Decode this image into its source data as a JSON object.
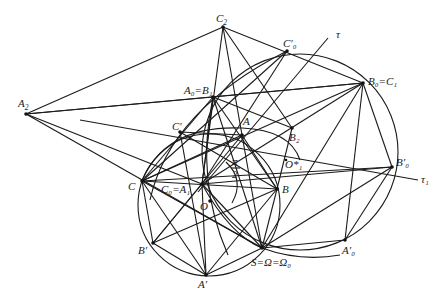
{
  "figure": {
    "points": [
      {
        "id": "C2",
        "label": "C",
        "sub": "2",
        "prime": false
      },
      {
        "id": "A2",
        "label": "A",
        "sub": "2",
        "prime": false
      },
      {
        "id": "A0B1",
        "label": "A₀=B₁"
      },
      {
        "id": "B0C1",
        "label": "B₀=C₁"
      },
      {
        "id": "C0p",
        "label": "C′₀"
      },
      {
        "id": "A",
        "label": "A"
      },
      {
        "id": "B2",
        "label": "B₂"
      },
      {
        "id": "Cp",
        "label": "C′"
      },
      {
        "id": "C",
        "label": "C"
      },
      {
        "id": "C0A1",
        "label": "C₀=A₁"
      },
      {
        "id": "B",
        "label": "B"
      },
      {
        "id": "O",
        "label": "O"
      },
      {
        "id": "O1s",
        "label": "O*₁"
      },
      {
        "id": "Bp",
        "label": "B′"
      },
      {
        "id": "Ap",
        "label": "A′"
      },
      {
        "id": "S",
        "label": "S=Ω=Ω₀"
      },
      {
        "id": "A0p",
        "label": "A′₀"
      },
      {
        "id": "B0p",
        "label": "B′₀"
      }
    ],
    "lines_labels": {
      "tau": "τ",
      "tau1": "τ₁"
    },
    "angle_label": {
      "numerator": "π",
      "denominator": "2"
    }
  }
}
